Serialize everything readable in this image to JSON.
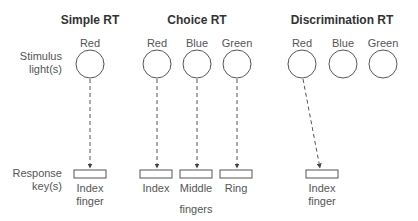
{
  "headers": {
    "simple": "Simple RT",
    "choice": "Choice RT",
    "discrimination": "Discrimination RT"
  },
  "row_labels": {
    "stimulus_line1": "Stimulus",
    "stimulus_line2": "light(s)",
    "response_line1": "Response",
    "response_line2": "key(s)"
  },
  "simple": {
    "lights": [
      "Red"
    ],
    "keys": [
      {
        "line1": "Index",
        "line2": "finger"
      }
    ]
  },
  "choice": {
    "lights": [
      "Red",
      "Blue",
      "Green"
    ],
    "keys": [
      {
        "line1": "Index"
      },
      {
        "line1": "Middle"
      },
      {
        "line1": "Ring"
      }
    ],
    "group_label": "fingers"
  },
  "discrimination": {
    "lights": [
      "Red",
      "Blue",
      "Green"
    ],
    "keys": [
      {
        "line1": "Index",
        "line2": "finger"
      }
    ]
  },
  "colors": {
    "stroke": "#555555",
    "text": "#4a4a4a"
  }
}
